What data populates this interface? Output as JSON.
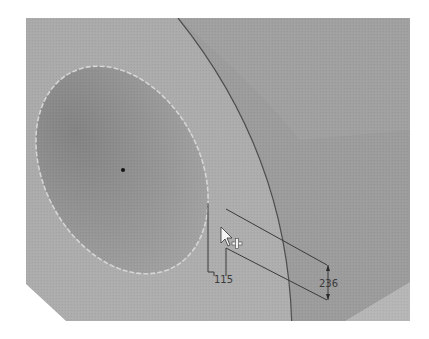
{
  "viewport": {
    "description": "3D CAD viewport showing a face with an elliptical hole and dimension annotations",
    "colors": {
      "background": "#ffffff",
      "face_light": "#aaaaaa",
      "face_right": "#9a9a9a",
      "hole_fill_dark": "#8a8a8a",
      "hole_fill_light": "#a2a2a2",
      "edge_line": "#555555",
      "hole_outline": "#d8d8d8",
      "dimension_line": "#3a3a3a",
      "corner_face": "#b8b8b8"
    }
  },
  "dimensions": {
    "horizontal_label": "115",
    "vertical_label": "236"
  },
  "cursor": {
    "icon": "arrow-pointer-with-plus",
    "plus_glyph": "+"
  }
}
